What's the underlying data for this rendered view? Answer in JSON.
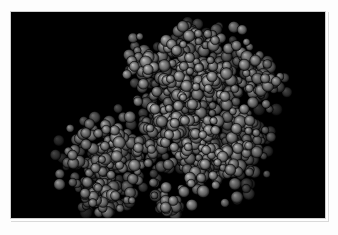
{
  "figure": {
    "title": "Space-filling molecular structure",
    "caption": "",
    "representation": "space-filling (CPK) spheres",
    "subject": "bilobed macromolecule",
    "background_color": "#000000",
    "page_color": "#fdfdfd",
    "border_color": "#cfcfcf"
  },
  "viewport": {
    "label": "molecular render viewport",
    "x": 10,
    "y": 11,
    "width": 316,
    "height": 208
  },
  "chart_data": {
    "type": "scatter",
    "title": "Space-filling molecular structure",
    "xlabel": "",
    "ylabel": "",
    "xlim": [
      0,
      316
    ],
    "ylim": [
      0,
      208
    ],
    "grid": false,
    "legend": null,
    "render": {
      "style": "cpk-spheres",
      "shading": "specular-diffuse",
      "light_direction": "upper-left",
      "atom_color_base": "#6e6e6e",
      "atom_color_highlight": "#c8c8c8",
      "atom_color_shadow": "#101010",
      "outline_color": "#000000",
      "sphere_radius_px": [
        3.6,
        6.4
      ],
      "atom_count": 1150
    },
    "lobes": [
      {
        "name": "upper-right lobe",
        "center_x": 196,
        "center_y": 62,
        "radius_x": 70,
        "radius_y": 48,
        "density": 1.0
      },
      {
        "name": "central bridge",
        "center_x": 168,
        "center_y": 112,
        "radius_x": 62,
        "radius_y": 42,
        "density": 1.0
      },
      {
        "name": "lower-left lobe",
        "center_x": 98,
        "center_y": 150,
        "radius_x": 54,
        "radius_y": 44,
        "density": 1.0
      },
      {
        "name": "lower-right lobe",
        "center_x": 200,
        "center_y": 148,
        "radius_x": 56,
        "radius_y": 42,
        "density": 0.95
      },
      {
        "name": "upper-left arm",
        "center_x": 142,
        "center_y": 52,
        "radius_x": 34,
        "radius_y": 30,
        "density": 0.85
      },
      {
        "name": "top spur",
        "center_x": 186,
        "center_y": 26,
        "radius_x": 26,
        "radius_y": 16,
        "density": 0.8
      },
      {
        "name": "right shoulder",
        "center_x": 248,
        "center_y": 72,
        "radius_x": 28,
        "radius_y": 30,
        "density": 0.85
      },
      {
        "name": "lower-left foot",
        "center_x": 92,
        "center_y": 186,
        "radius_x": 34,
        "radius_y": 20,
        "density": 0.8
      },
      {
        "name": "bottom-center tail",
        "center_x": 160,
        "center_y": 192,
        "radius_x": 26,
        "radius_y": 16,
        "density": 0.7
      },
      {
        "name": "right lower edge",
        "center_x": 240,
        "center_y": 132,
        "radius_x": 24,
        "radius_y": 26,
        "density": 0.7
      }
    ],
    "bounds": {
      "molecule_left": 48,
      "molecule_right": 262,
      "molecule_top": 8,
      "molecule_bottom": 200
    }
  }
}
